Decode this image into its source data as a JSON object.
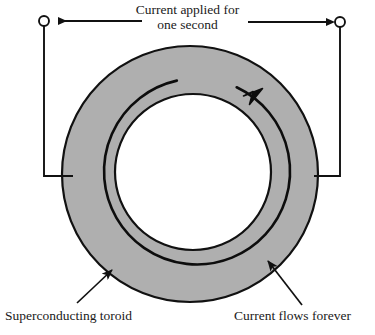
{
  "figure": {
    "width": 375,
    "height": 335,
    "background_color": "#ffffff"
  },
  "labels": {
    "top_line1": "Current applied for",
    "top_line2": "one second",
    "bottom_left": "Superconducting toroid",
    "bottom_right": "Current flows forever",
    "cut_caption": ""
  },
  "colors": {
    "toroid_fill": "#afafaf",
    "outline": "#111111",
    "current_line": "#0d0d0d",
    "wire": "#111111",
    "hole_fill": "#ffffff",
    "text": "#1a1a1a"
  },
  "geometry": {
    "toroid_outer": {
      "cx": 190,
      "cy": 174,
      "r": 128
    },
    "toroid_inner": {
      "cx": 193,
      "cy": 172,
      "r": 78
    },
    "current_arc": {
      "cx": 192,
      "cy": 173,
      "r": 93
    },
    "terminal_left": {
      "cx": 44,
      "cy": 21,
      "r": 5
    },
    "terminal_right": {
      "cx": 340,
      "cy": 22,
      "r": 5
    },
    "wire_bottom_y": 176,
    "wire_left_contact_x": 73,
    "wire_right_contact_x": 314
  },
  "icons": {
    "terminal": "open-circle-terminal",
    "flow_arrow": "current-direction-arrowhead",
    "leader_arrow": "callout-leader-arrowhead",
    "supply_arrow": "supply-current-arrowhead"
  }
}
